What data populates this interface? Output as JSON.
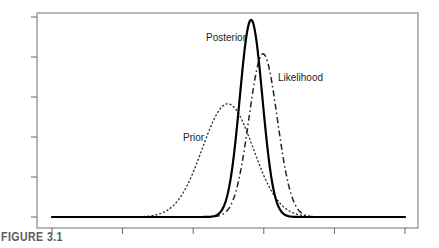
{
  "caption": "FIGURE 3.1",
  "chart_data": {
    "type": "line",
    "title": "",
    "xlabel": "",
    "ylabel": "",
    "x_ticks": 6,
    "y_ticks": 6,
    "xlim": [
      0,
      5
    ],
    "ylim": [
      0,
      5
    ],
    "tick_labels_shown": false,
    "grid": false,
    "legend": "none (inline curve labels)",
    "series": [
      {
        "name": "Prior",
        "style": "dotted",
        "color": "#333333",
        "distribution": "normal",
        "mean": 2.49,
        "sd": 0.36,
        "peak_height": 2.83,
        "label": "Prior"
      },
      {
        "name": "Likelihood",
        "style": "dash-dot",
        "color": "#222222",
        "distribution": "normal",
        "mean": 2.99,
        "sd": 0.2,
        "peak_height": 4.08,
        "label": "Likelihood"
      },
      {
        "name": "Posterior",
        "style": "solid",
        "color": "#000000",
        "distribution": "normal",
        "mean": 2.82,
        "sd": 0.16,
        "peak_height": 4.93,
        "label": "Posterior"
      }
    ]
  }
}
